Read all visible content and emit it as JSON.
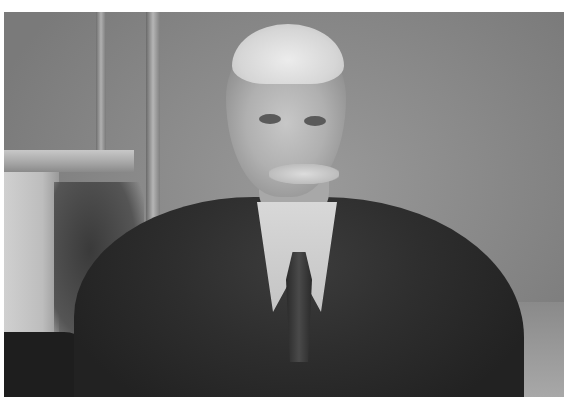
{
  "image": {
    "type": "photograph",
    "description": "Black-and-white portrait of an elderly man with white hair and a white mustache, wearing a dark suit, white collared shirt and dark tie, seated in a room with a fireplace mantel at left",
    "colors": {
      "background_border": "#ffffff",
      "wall": "#8a8a8a",
      "jacket": "#2e2e2e",
      "shirt": "#d0d0d0",
      "hair": "#e0e0e0"
    }
  }
}
